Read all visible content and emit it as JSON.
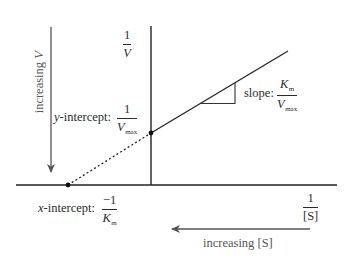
{
  "diagram": {
    "type": "lineweaver-burk-plot",
    "colors": {
      "axis": "#222222",
      "plot_line": "#222222",
      "arrow": "#555555",
      "text": "#2a2a2a"
    },
    "y_axis": {
      "label_num": "1",
      "label_den": "V"
    },
    "x_axis": {
      "label_num": "1",
      "label_den": "[S]"
    },
    "y_intercept": {
      "prefix": "y",
      "text": "-intercept:",
      "num": "1",
      "den_var": "V",
      "den_sub": "max"
    },
    "x_intercept": {
      "prefix": "x",
      "text": "-intercept:",
      "num": "−1",
      "den_var": "K",
      "den_sub": "m"
    },
    "slope": {
      "text": "slope:",
      "num_var": "K",
      "num_sub": "m",
      "den_var": "V",
      "den_sub": "max"
    },
    "increasing_v": {
      "text": "increasing ",
      "var": "V"
    },
    "increasing_s": {
      "text": "increasing [S]"
    }
  }
}
